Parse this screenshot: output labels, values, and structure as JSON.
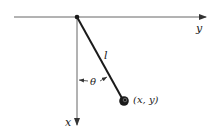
{
  "diagram": {
    "type": "pendulum",
    "labels": {
      "horizontal_axis": "y",
      "vertical_axis": "x",
      "rod_length": "l",
      "angle": "θ",
      "bob_position": "(x, y)"
    },
    "colors": {
      "line": "#1a1a1a",
      "axis": "#555555",
      "background": "#ffffff"
    }
  }
}
